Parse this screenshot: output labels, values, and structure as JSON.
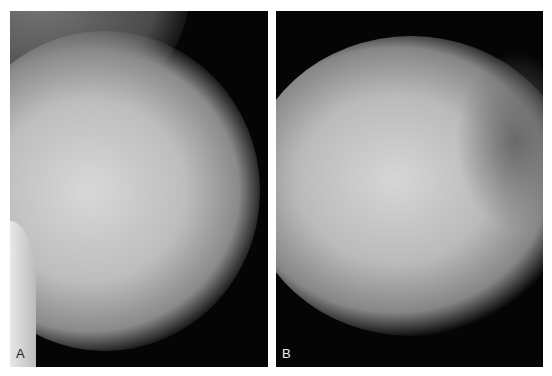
{
  "figure": {
    "panels": [
      {
        "id": "A",
        "label": "A",
        "description": "mammogram mediolateral oblique view, dense fibroglandular tissue"
      },
      {
        "id": "B",
        "label": "B",
        "description": "mammogram craniocaudal view, dense fibroglandular tissue"
      }
    ],
    "colors": {
      "background": "#ffffff",
      "film": "#050505",
      "tissue": "#c8c8c8"
    }
  }
}
